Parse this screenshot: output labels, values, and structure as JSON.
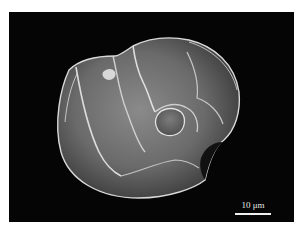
{
  "figure": {
    "background_color": "#050505",
    "scale_bar": {
      "label": "10 μm",
      "color": "#f0f0f0"
    },
    "caption_partial": ""
  }
}
